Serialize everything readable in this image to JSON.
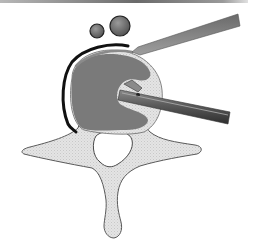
{
  "figure": {
    "type": "medical-illustration",
    "subject": "Axial view of vertebra with surgical instruments in vertebral body",
    "colors": {
      "background": "#ffffff",
      "bone": "#e2e2e2",
      "bone_outline": "#5a5a5a",
      "vertebral_body": "#7a7a7a",
      "body_rim_light": "#d6d6d6",
      "canal": "#ffffff",
      "dura_line": "#111111",
      "vessel_fill": "#6e6e6e",
      "instrument_dark": "#4a4a4a",
      "instrument_light": "#9c9c9c"
    },
    "elements": {
      "vessels": [
        "small-vessel",
        "large-vessel"
      ],
      "instruments": [
        "retractor",
        "grasping-forceps"
      ],
      "anatomy": [
        "vertebral-body",
        "spinal-canal",
        "transverse-process-left",
        "transverse-process-right",
        "spinous-process"
      ]
    }
  }
}
